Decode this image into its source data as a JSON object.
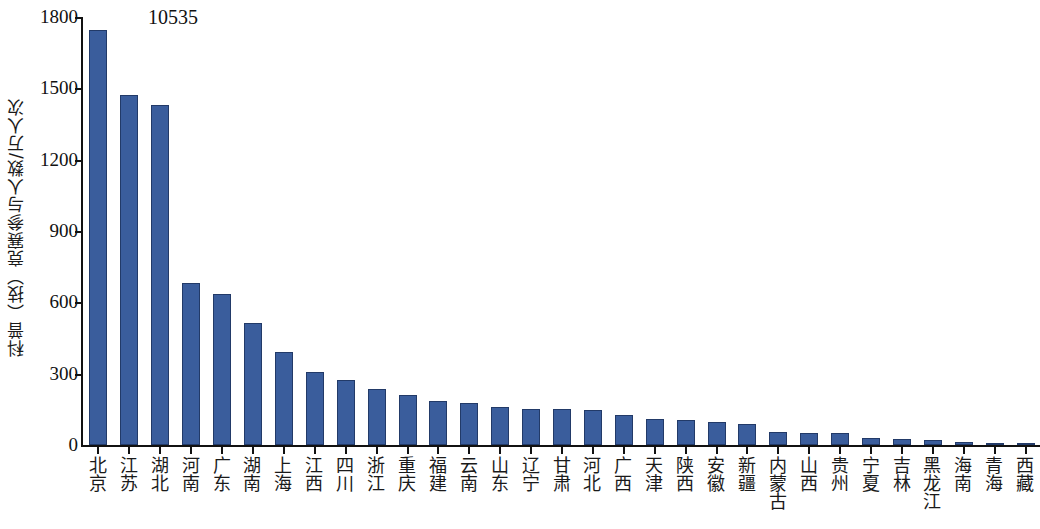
{
  "chart_data": {
    "type": "bar",
    "title": "",
    "subtitle": "",
    "xlabel": "",
    "ylabel": "科普（技）竞赛参与人数/万人次",
    "ylim": [
      0,
      1800
    ],
    "yticks": [
      0,
      300,
      600,
      900,
      1200,
      1500,
      1800
    ],
    "ytick_labels": [
      "0",
      "300",
      "600",
      "900",
      "1200",
      "1500",
      "1800"
    ],
    "grid": false,
    "legend": null,
    "annotations": [
      {
        "text": "10535",
        "target_category": "北京",
        "note": "value label printed above the first (tallest) bar"
      }
    ],
    "bar_color": "#3a5d9c",
    "bar_edge_color": "#223a68",
    "axis_color": "#111111",
    "categories": [
      "北京",
      "江苏",
      "湖北",
      "河南",
      "广东",
      "湖南",
      "上海",
      "江西",
      "四川",
      "浙江",
      "重庆",
      "福建",
      "云南",
      "山东",
      "辽宁",
      "甘肃",
      "河北",
      "广西",
      "天津",
      "陕西",
      "安徽",
      "新疆",
      "内蒙古",
      "山西",
      "贵州",
      "宁夏",
      "吉林",
      "黑龙江",
      "海南",
      "青海",
      "西藏"
    ],
    "values": [
      1745,
      1470,
      1430,
      683,
      637,
      512,
      390,
      305,
      272,
      235,
      212,
      185,
      178,
      158,
      153,
      150,
      148,
      125,
      110,
      105,
      98,
      88,
      55,
      52,
      50,
      28,
      25,
      20,
      12,
      8,
      3
    ]
  }
}
